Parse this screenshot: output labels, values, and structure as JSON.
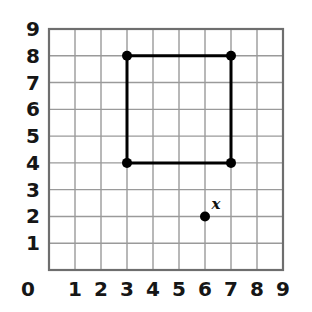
{
  "chart_data": {
    "type": "scatter",
    "title": "",
    "xlabel": "",
    "ylabel": "",
    "xlim": [
      0,
      9
    ],
    "ylim": [
      0,
      9
    ],
    "grid": true,
    "legend": false,
    "x_ticks": [
      "0",
      "1",
      "2",
      "3",
      "4",
      "5",
      "6",
      "7",
      "8",
      "9"
    ],
    "y_ticks": [
      "1",
      "2",
      "3",
      "4",
      "5",
      "6",
      "7",
      "8",
      "9"
    ],
    "x_tick_values": [
      0,
      1,
      2,
      3,
      4,
      5,
      6,
      7,
      8,
      9
    ],
    "y_tick_values": [
      1,
      2,
      3,
      4,
      5,
      6,
      7,
      8,
      9
    ],
    "shapes": [
      {
        "name": "rectangle",
        "kind": "polygon",
        "closed": true,
        "color": "#000000",
        "stroke_width": 3,
        "vertices": [
          {
            "x": 3,
            "y": 4
          },
          {
            "x": 3,
            "y": 8
          },
          {
            "x": 7,
            "y": 8
          },
          {
            "x": 7,
            "y": 4
          }
        ],
        "vertex_markers": true
      }
    ],
    "points": [
      {
        "name": "point-x",
        "x": 6,
        "y": 2,
        "label": "x",
        "color": "#000000",
        "radius": 5
      }
    ]
  },
  "figure": {
    "background_color": "#ffffff",
    "grid_line_color": "#9a9a9a",
    "border_color": "#6e6e6e",
    "axis_text_color": "#161616",
    "plot_left_px": 49,
    "plot_top_px": 29,
    "plot_right_px": 283,
    "plot_bottom_px": 270
  }
}
